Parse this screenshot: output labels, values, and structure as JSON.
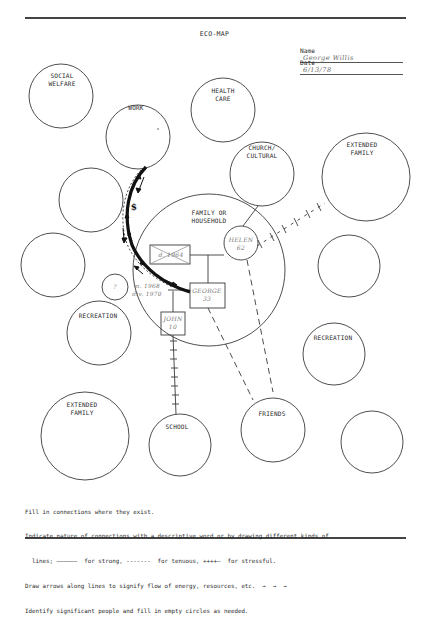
{
  "header": {
    "title": "ECO-MAP",
    "name_label": "Name",
    "name_value": "George Willis",
    "date_label": "Date",
    "date_value": "6/13/78"
  },
  "circles": {
    "social_welfare": "SOCIAL\nWELFARE",
    "work": "WORK",
    "health_care": "HEALTH\nCARE",
    "church_cultural": "CHURCH/\nCULTURAL",
    "extended_family_right": "EXTENDED\nFAMILY",
    "family_household": "FAMILY OR\nHOUSEHOLD",
    "recreation_left": "RECREATION",
    "recreation_right": "RECREATION",
    "extended_family_left": "EXTENDED\nFAMILY",
    "school": "SCHOOL",
    "friends": "FRIENDS",
    "unknown_small": "?"
  },
  "family_members": {
    "ex_spouse": "d. 1964",
    "helen": "HELEN\n62",
    "george": "GEORGE\n33",
    "john": "JOHN\n10",
    "marriage_note": "m. 1968\ndiv. 1970"
  },
  "work_connection_symbol": "$",
  "instructions": [
    "Fill in connections where they exist.",
    "Indicate nature of connections with a descriptive word or by drawing different kinds of",
    "  lines; ——————  for strong, -------  for tenuous, ++++—  for stressful.",
    "Draw arrows along lines to signify flow of energy, resources, etc.  →  →  →",
    "Identify significant people and fill in empty circles as needed."
  ],
  "legend": {
    "strong": "for strong,",
    "tenuous": "for tenuous,",
    "stressful": "for stressful."
  }
}
